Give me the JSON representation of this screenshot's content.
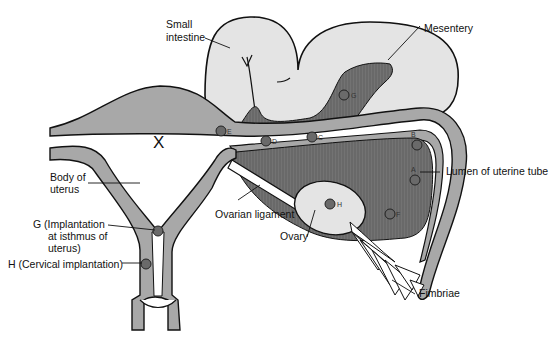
{
  "diagram": {
    "labels": {
      "small_intestine_1": "Small",
      "small_intestine_2": "intestine",
      "mesentery": "Mesentery",
      "lumen": "Lumen of uterine tube",
      "body_uterus_1": "Body of",
      "body_uterus_2": "uterus",
      "g_1": "G (Implantation",
      "g_2": "at isthmus of",
      "g_3": "uterus)",
      "h": "H (Cervical implantation)",
      "ovarian_ligament": "Ovarian ligament",
      "ovary": "Ovary",
      "fimbriae": "Fimbriae",
      "x_mark": "X"
    },
    "sites": [
      {
        "id": "A",
        "label": "A"
      },
      {
        "id": "B",
        "label": "B"
      },
      {
        "id": "C",
        "label": "C"
      },
      {
        "id": "D",
        "label": "D"
      },
      {
        "id": "E",
        "label": "E"
      },
      {
        "id": "F",
        "label": "F"
      },
      {
        "id": "G_mesentery",
        "label": "G"
      },
      {
        "id": "H_ovary",
        "label": "H"
      }
    ],
    "colors": {
      "tissue": "#a8a8a8",
      "intestine": "#e4e4e4",
      "mesentery": "#6e6e6e",
      "outline": "#111111",
      "site": "#6a6a6a"
    }
  }
}
